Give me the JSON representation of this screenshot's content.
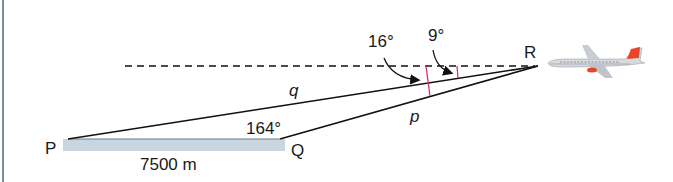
{
  "diagram": {
    "type": "trigonometry-triangle",
    "points": {
      "P": {
        "label": "P"
      },
      "Q": {
        "label": "Q"
      },
      "R": {
        "label": "R"
      }
    },
    "sides": {
      "q": {
        "label": "q",
        "from": "P",
        "to": "R"
      },
      "p": {
        "label": "p",
        "from": "Q",
        "to": "R"
      },
      "PQ": {
        "label": "7500 m",
        "from": "P",
        "to": "Q"
      }
    },
    "angles": {
      "depression_P": {
        "label": "16°",
        "at": "R",
        "description": "angle of depression to P"
      },
      "depression_Q": {
        "label": "9°",
        "at": "R",
        "description": "angle of depression to Q"
      },
      "PQR": {
        "label": "164°",
        "at": "Q"
      }
    },
    "horizontal_line": "dashed line through R",
    "icons": {
      "airplane": "airplane-icon",
      "ground": "runway-strip"
    },
    "colors": {
      "line": "#111111",
      "angle_mark": "#d9336a",
      "ground": "#c9d6df",
      "border": "#7d8aa3",
      "plane_body": "#d8dade",
      "plane_tail": "#e8452c"
    }
  }
}
